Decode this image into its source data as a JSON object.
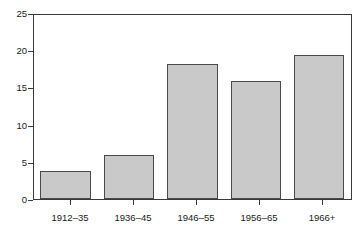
{
  "chart_data": {
    "type": "bar",
    "title": "",
    "xlabel": "",
    "ylabel": "",
    "categories": [
      "1912–35",
      "1936–45",
      "1946–55",
      "1956–65",
      "1966+"
    ],
    "values": [
      3.8,
      6.0,
      18.3,
      16.0,
      19.5
    ],
    "ylim": [
      0,
      25
    ],
    "yticks": [
      0,
      5,
      10,
      15,
      20,
      25
    ],
    "ytick_labels": [
      "0",
      "5",
      "10",
      "15",
      "20",
      "25"
    ],
    "grid": false,
    "legend": null,
    "legend_position": "none",
    "bar_fill_color": "#c9c9c9",
    "bar_border_color": "#4a4a4a",
    "axis_color": "#3a3a3a",
    "background_color": "#ffffff"
  }
}
